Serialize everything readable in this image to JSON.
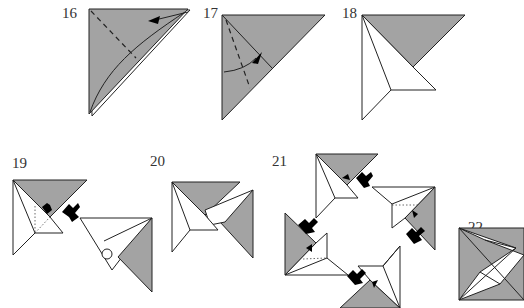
{
  "diagram": {
    "steps": [
      {
        "number": "16",
        "instruction": "valley fold with arrow along curved path"
      },
      {
        "number": "17",
        "instruction": "valley fold along dashed line"
      },
      {
        "number": "18",
        "instruction": "result unit"
      },
      {
        "number": "19",
        "instruction": "insert two units together"
      },
      {
        "number": "20",
        "instruction": "units joined"
      },
      {
        "number": "21",
        "instruction": "assemble four units"
      },
      {
        "number": "22",
        "instruction": "finished pinwheel square"
      }
    ],
    "colors": {
      "paper_colored": "#a3a3a3",
      "paper_white": "#ffffff",
      "outline": "#222222",
      "insert_mark": "#000000"
    }
  }
}
